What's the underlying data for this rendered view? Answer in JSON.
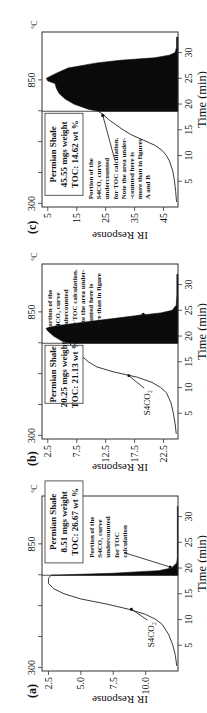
{
  "figure": {
    "orientation": "rotated 90 degrees counterclockwise",
    "panels": [
      {
        "id": "c",
        "label": "(c)",
        "info_box": [
          "Permian Shale",
          "45.55 mgs weight",
          "TOC: 14.62 wt %"
        ],
        "annotation": [
          "Portion of the",
          "S4CO₂ curve",
          "undercounted",
          "for TOC calculation.",
          "Note the area under-",
          "-counted here is",
          "more than in figures",
          "A and B"
        ],
        "curve_label": "",
        "y_ticks": [
          "45",
          "35",
          "25",
          "15",
          "5"
        ],
        "ylabel": "IR Response"
      },
      {
        "id": "b",
        "label": "(b)",
        "info_box": [
          "Permian Shale",
          "20.25 mgs weight",
          "TOC: 21.13 wt %"
        ],
        "annotation": [
          "Portion of the",
          "S4CO₂ curve",
          "undercounted",
          "for TOC calculation.",
          "Note the area under-",
          "-counted here is",
          "more than in figure",
          "A"
        ],
        "curve_label": "S4CO₂",
        "y_ticks": [
          "22.5",
          "17.5",
          "12.5",
          "7.5",
          "2.5"
        ],
        "ylabel": "IR Response"
      },
      {
        "id": "a",
        "label": "(a)",
        "info_box": [
          "Permian Shale",
          "8.51 mgs weight",
          "TOC: 26.67 wt %"
        ],
        "annotation": [
          "Portion of the",
          "S4CO₂ curve",
          "undercounted",
          "for TOC",
          "calculation"
        ],
        "curve_label": "S4CO₂",
        "y_ticks": [
          "10.0",
          "7.5",
          "5.0",
          "2.5"
        ],
        "ylabel": "IR Response"
      }
    ],
    "temp_ticks": [
      "300",
      "850"
    ],
    "temp_unit": "°C",
    "x_ticks": [
      "5",
      "10",
      "15",
      "20",
      "25",
      "30"
    ],
    "xlabel": "Time (min)"
  },
  "chart_data": [
    {
      "type": "area",
      "title": "(c) Permian Shale, 45.55 mgs weight, TOC: 14.62 wt %",
      "xlabel": "Time (min)",
      "ylabel": "IR Response",
      "secondary_axis": {
        "label": "°C",
        "ticks": [
          300,
          850
        ]
      },
      "xlim": [
        0,
        34
      ],
      "ylim": [
        0,
        47
      ],
      "x_ticks": [
        5,
        10,
        15,
        20,
        25,
        30
      ],
      "y_ticks": [
        5,
        15,
        25,
        35,
        45
      ],
      "cutoff_time": 18.6,
      "series": [
        {
          "name": "S4CO2 curve",
          "x": [
            1,
            3,
            5,
            7,
            9,
            10,
            11,
            12,
            13,
            14,
            15,
            16,
            17,
            18,
            18.6
          ],
          "y": [
            0.5,
            0.8,
            1.2,
            1.8,
            3,
            4,
            5.5,
            8,
            12,
            16,
            19,
            21.5,
            24,
            26,
            27.5
          ]
        },
        {
          "name": "Undercounted portion (filled)",
          "x": [
            18.6,
            19,
            20,
            21,
            22,
            23,
            24,
            24.5,
            25,
            26,
            27,
            28,
            28.5,
            29,
            29.5,
            30,
            31,
            32,
            33
          ],
          "y": [
            27.5,
            31,
            36,
            39,
            41,
            42,
            42.5,
            45,
            45.5,
            42,
            38,
            28,
            20,
            8,
            3,
            1,
            0.5,
            0.5,
            0.5
          ]
        }
      ],
      "annotations": [
        "Portion of the S4CO2 curve undercounted for TOC calculation. Note the area under-counted here is more than in figures A and B"
      ]
    },
    {
      "type": "area",
      "title": "(b) Permian Shale, 20.25 mgs weight, TOC: 21.13 wt %",
      "xlabel": "Time (min)",
      "ylabel": "IR Response",
      "secondary_axis": {
        "label": "°C",
        "ticks": [
          300,
          850
        ]
      },
      "xlim": [
        0,
        34
      ],
      "ylim": [
        0,
        23.5
      ],
      "x_ticks": [
        5,
        10,
        15,
        20,
        25,
        30
      ],
      "y_ticks": [
        2.5,
        7.5,
        12.5,
        17.5,
        22.5
      ],
      "cutoff_time": 18.6,
      "series": [
        {
          "name": "S4CO2",
          "x": [
            1,
            3,
            5,
            7,
            9,
            10,
            11,
            12,
            13,
            14,
            15,
            16,
            17,
            18,
            18.6
          ],
          "y": [
            0.3,
            0.5,
            0.8,
            1.2,
            2,
            3,
            4.5,
            7,
            11,
            14,
            15.5,
            16.5,
            17.5,
            18.2,
            18.8
          ]
        },
        {
          "name": "Undercounted portion (filled)",
          "x": [
            18.6,
            19,
            20,
            21,
            21.5,
            22,
            23,
            24,
            24.5,
            25,
            26,
            28,
            30,
            32
          ],
          "y": [
            18.8,
            20,
            21.5,
            22.5,
            22.8,
            21,
            14,
            7,
            3,
            1,
            0.3,
            0.2,
            0.2,
            0.2
          ]
        }
      ],
      "annotations": [
        "S4CO2",
        "Portion of the S4CO2 curve undercounted for TOC calculation. Note the area under-counted here is more than in figure A"
      ]
    },
    {
      "type": "area",
      "title": "(a) Permian Shale, 8.51 mgs weight, TOC: 26.67 wt %",
      "xlabel": "Time (min)",
      "ylabel": "IR Response",
      "secondary_axis": {
        "label": "°C",
        "ticks": [
          300,
          850
        ]
      },
      "xlim": [
        0,
        34
      ],
      "ylim": [
        0,
        10.5
      ],
      "x_ticks": [
        5,
        10,
        15,
        20,
        25,
        30
      ],
      "y_ticks": [
        2.5,
        5.0,
        7.5,
        10.0
      ],
      "cutoff_time": 18.6,
      "series": [
        {
          "name": "S4CO2",
          "x": [
            1,
            3,
            5,
            7,
            9,
            10,
            11,
            12,
            13,
            14,
            15,
            16,
            17,
            18,
            18.6
          ],
          "y": [
            0.1,
            0.2,
            0.4,
            0.7,
            1.2,
            1.7,
            2.5,
            3.8,
            5.5,
            7.5,
            8.8,
            9.6,
            10,
            10,
            9.8
          ]
        },
        {
          "name": "Undercounted portion (filled)",
          "x": [
            18.6,
            19,
            19.5,
            20,
            21,
            22,
            25,
            30,
            32
          ],
          "y": [
            9.8,
            5,
            1.5,
            0.5,
            0.1,
            0.05,
            0.05,
            0.05,
            0.05
          ]
        }
      ],
      "annotations": [
        "S4CO2",
        "Portion of the S4CO2 curve undercounted for TOC calculation"
      ]
    }
  ]
}
